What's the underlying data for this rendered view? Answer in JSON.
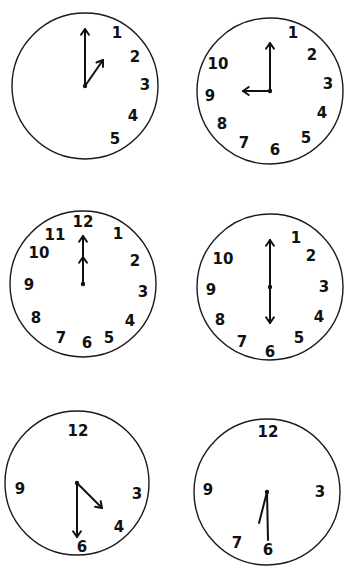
{
  "worksheet": {
    "clocks": [
      {
        "id": "clock-1",
        "center": [
          85,
          86
        ],
        "radius": 73,
        "numerals": [
          {
            "label": "1",
            "x": 117,
            "y": 33
          },
          {
            "label": "2",
            "x": 135,
            "y": 57
          },
          {
            "label": "3",
            "x": 145,
            "y": 85
          },
          {
            "label": "4",
            "x": 133,
            "y": 116
          },
          {
            "label": "5",
            "x": 115,
            "y": 139
          }
        ],
        "hands": [
          {
            "type": "minute",
            "x2": 85,
            "y2": 29,
            "arrow": true
          },
          {
            "type": "hour",
            "x2": 103,
            "y2": 60,
            "arrow": true
          }
        ]
      },
      {
        "id": "clock-2",
        "center": [
          270,
          91
        ],
        "radius": 73,
        "numerals": [
          {
            "label": "1",
            "x": 293,
            "y": 33
          },
          {
            "label": "2",
            "x": 312,
            "y": 55
          },
          {
            "label": "3",
            "x": 328,
            "y": 84
          },
          {
            "label": "4",
            "x": 322,
            "y": 113
          },
          {
            "label": "5",
            "x": 306,
            "y": 138
          },
          {
            "label": "6",
            "x": 275,
            "y": 150
          },
          {
            "label": "7",
            "x": 244,
            "y": 143
          },
          {
            "label": "8",
            "x": 222,
            "y": 124
          },
          {
            "label": "9",
            "x": 210,
            "y": 96
          },
          {
            "label": "10",
            "x": 218,
            "y": 64
          }
        ],
        "hands": [
          {
            "type": "minute",
            "x2": 270,
            "y2": 43,
            "arrow": true
          },
          {
            "type": "hour",
            "x2": 243,
            "y2": 91,
            "arrow": true
          }
        ]
      },
      {
        "id": "clock-3",
        "center": [
          83,
          284
        ],
        "radius": 73,
        "numerals": [
          {
            "label": "12",
            "x": 83,
            "y": 222
          },
          {
            "label": "1",
            "x": 118,
            "y": 234
          },
          {
            "label": "2",
            "x": 135,
            "y": 261
          },
          {
            "label": "3",
            "x": 143,
            "y": 292
          },
          {
            "label": "4",
            "x": 130,
            "y": 321
          },
          {
            "label": "5",
            "x": 109,
            "y": 338
          },
          {
            "label": "6",
            "x": 87,
            "y": 343
          },
          {
            "label": "7",
            "x": 61,
            "y": 338
          },
          {
            "label": "8",
            "x": 36,
            "y": 318
          },
          {
            "label": "9",
            "x": 29,
            "y": 285
          },
          {
            "label": "10",
            "x": 39,
            "y": 253
          },
          {
            "label": "11",
            "x": 55,
            "y": 235
          }
        ],
        "hands": [
          {
            "type": "minute",
            "x2": 83,
            "y2": 236,
            "arrow": true
          },
          {
            "type": "hour",
            "x2": 83,
            "y2": 257,
            "arrow": true
          }
        ]
      },
      {
        "id": "clock-4",
        "center": [
          270,
          287
        ],
        "radius": 73,
        "numerals": [
          {
            "label": "1",
            "x": 296,
            "y": 238
          },
          {
            "label": "2",
            "x": 311,
            "y": 256
          },
          {
            "label": "3",
            "x": 324,
            "y": 287
          },
          {
            "label": "4",
            "x": 319,
            "y": 317
          },
          {
            "label": "5",
            "x": 299,
            "y": 338
          },
          {
            "label": "6",
            "x": 270,
            "y": 352
          },
          {
            "label": "7",
            "x": 242,
            "y": 342
          },
          {
            "label": "8",
            "x": 220,
            "y": 320
          },
          {
            "label": "9",
            "x": 211,
            "y": 290
          },
          {
            "label": "10",
            "x": 223,
            "y": 259
          }
        ],
        "hands": [
          {
            "type": "minute",
            "x2": 270,
            "y2": 240,
            "arrow": true
          },
          {
            "type": "hour",
            "x2": 270,
            "y2": 323,
            "arrow": true
          }
        ]
      },
      {
        "id": "clock-5",
        "center": [
          77,
          483
        ],
        "radius": 72,
        "numerals": [
          {
            "label": "12",
            "x": 78,
            "y": 431
          },
          {
            "label": "3",
            "x": 137,
            "y": 494
          },
          {
            "label": "4",
            "x": 119,
            "y": 527
          },
          {
            "label": "6",
            "x": 82,
            "y": 547
          },
          {
            "label": "9",
            "x": 20,
            "y": 489
          }
        ],
        "hands": [
          {
            "type": "minute",
            "x2": 77,
            "y2": 537,
            "arrow": true
          },
          {
            "type": "hour",
            "x2": 102,
            "y2": 508,
            "arrow": true
          }
        ]
      },
      {
        "id": "clock-6",
        "center": [
          267,
          492
        ],
        "radius": 73,
        "numerals": [
          {
            "label": "12",
            "x": 268,
            "y": 432
          },
          {
            "label": "3",
            "x": 320,
            "y": 492
          },
          {
            "label": "6",
            "x": 268,
            "y": 550
          },
          {
            "label": "7",
            "x": 237,
            "y": 543
          },
          {
            "label": "9",
            "x": 208,
            "y": 490
          }
        ],
        "hands": [
          {
            "type": "minute",
            "x2": 268,
            "y2": 540,
            "arrow": false
          },
          {
            "type": "hour",
            "x2": 259,
            "y2": 523,
            "arrow": false
          }
        ]
      }
    ],
    "colors": {
      "ink": "#111111",
      "paper": "#ffffff"
    }
  }
}
